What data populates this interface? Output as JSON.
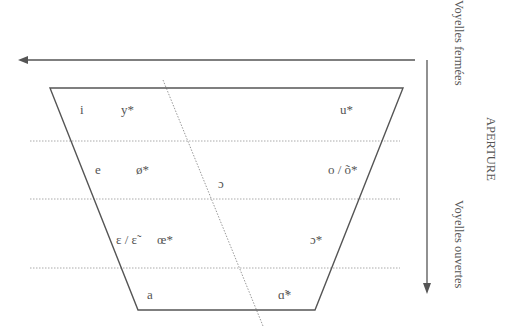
{
  "diagram": {
    "axis_labels": {
      "closed": "Voyelles fermées",
      "aperture": "APERTURE",
      "open": "Voyelles ouvertes"
    },
    "vowels": {
      "row1": {
        "front_unrounded": "i",
        "front_rounded": "y*",
        "back": "u*"
      },
      "row2": {
        "front_unrounded": "e",
        "front_rounded": "ø*",
        "central": "ɔ",
        "back": "o / õ*"
      },
      "row3": {
        "front_unrounded": "ɛ / ɛ̃",
        "front_rounded": "œ*",
        "back": "ɔ*"
      },
      "row4": {
        "front": "a",
        "back": "ɑ̃*"
      }
    },
    "colors": {
      "line": "#555555",
      "dotted": "#aaaaaa",
      "text": "#555555"
    }
  }
}
